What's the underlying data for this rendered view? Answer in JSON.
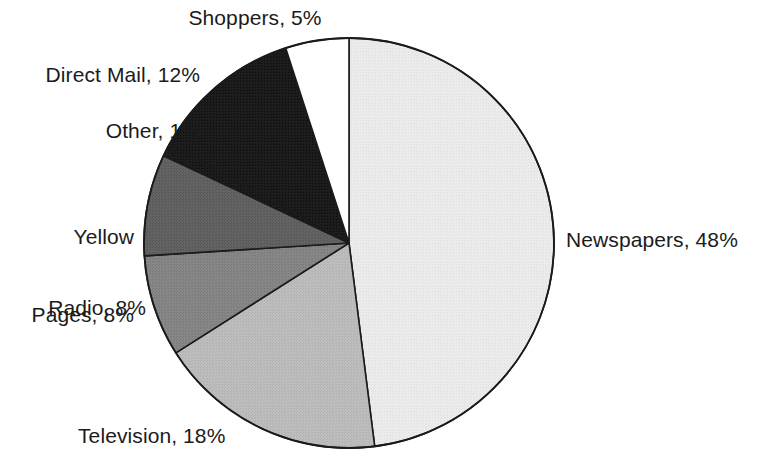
{
  "chart_data": {
    "type": "pie",
    "title": "",
    "subtitle": "",
    "xlabel": "",
    "ylabel": "",
    "legend_position": "none",
    "grid": false,
    "labels_inline": true,
    "start_angle_deg": 0,
    "direction": "clockwise",
    "units": "%",
    "categories": [
      "Newspapers",
      "Television",
      "Radio",
      "Yellow Pages",
      "Other",
      "Direct Mail",
      "Shoppers"
    ],
    "values": [
      48,
      18,
      8,
      8,
      1,
      12,
      5
    ],
    "total": 100,
    "slices": [
      {
        "name": "Newspapers",
        "value": 48,
        "label": "Newspapers, 48%",
        "color": "#e8e8e8",
        "stroke": "#1b1b1b",
        "start_deg": 0,
        "end_deg": 172.8
      },
      {
        "name": "Television",
        "value": 18,
        "label": "Television, 18%",
        "color": "#b9b9b9",
        "stroke": "#1b1b1b",
        "start_deg": 172.8,
        "end_deg": 237.6
      },
      {
        "name": "Radio",
        "value": 8,
        "label": "Radio, 8%",
        "color": "#828282",
        "stroke": "#1b1b1b",
        "start_deg": 237.6,
        "end_deg": 266.4
      },
      {
        "name": "Yellow Pages",
        "value": 8,
        "label_line1": "Yellow",
        "label_line2": "Pages, 8%",
        "label": "Yellow Pages, 8%",
        "color": "#5e5e5e",
        "stroke": "#1b1b1b",
        "start_deg": 266.4,
        "end_deg": 295.2
      },
      {
        "name": "Other",
        "value": 1,
        "label": "Other, 1%",
        "color": "#2c2c2c",
        "stroke": "#1b1b1b",
        "start_deg": 295.2,
        "end_deg": 298.8
      },
      {
        "name": "Direct Mail",
        "value": 12,
        "label": "Direct Mail, 12%",
        "color": "#1a1a1a",
        "stroke": "#1b1b1b",
        "start_deg": 298.8,
        "end_deg": 342.0
      },
      {
        "name": "Shoppers",
        "value": 5,
        "label": "Shoppers, 5%",
        "color": "#ffffff",
        "stroke": "#1b1b1b",
        "start_deg": 342.0,
        "end_deg": 360.0
      }
    ]
  },
  "geometry": {
    "center_x": 349,
    "center_y": 243,
    "radius": 205
  },
  "labels": {
    "newspapers": "Newspapers, 48%",
    "television": "Television, 18%",
    "radio": "Radio, 8%",
    "yellow_pages_line1": "Yellow",
    "yellow_pages_line2": "Pages, 8%",
    "other": "Other, 1%",
    "direct_mail": "Direct Mail, 12%",
    "shoppers": "Shoppers, 5%"
  }
}
